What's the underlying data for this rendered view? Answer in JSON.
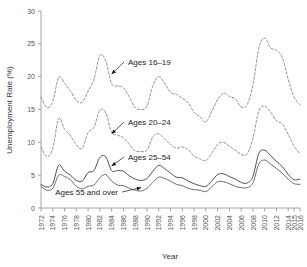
{
  "chart_data": {
    "type": "line",
    "title": "",
    "xlabel": "Year",
    "ylabel": "Unemployment Rate (%)",
    "xlim": [
      1972,
      2016
    ],
    "ylim": [
      0,
      30
    ],
    "ytick_values": [
      0,
      5,
      10,
      15,
      20,
      25,
      30
    ],
    "ytick_labels": [
      "0",
      "5",
      "10",
      "15",
      "20",
      "25",
      "30"
    ],
    "xtick_values": [
      1972,
      1974,
      1976,
      1978,
      1980,
      1982,
      1984,
      1986,
      1988,
      1990,
      1992,
      1994,
      1996,
      1998,
      2000,
      2002,
      2004,
      2006,
      2008,
      2010,
      2012,
      2014,
      2015,
      2016
    ],
    "xtick_labels": [
      "1972",
      "1974",
      "1976",
      "1978",
      "1980",
      "1982",
      "1984",
      "1986",
      "1988",
      "1990",
      "1992",
      "1994",
      "1996",
      "1998",
      "2000",
      "2002",
      "2004",
      "2006",
      "2008",
      "2010",
      "2012",
      "2014",
      "2015",
      "2016"
    ],
    "grid": false,
    "legend_position": "inline-annotations",
    "x": [
      1972,
      1973,
      1974,
      1975,
      1976,
      1977,
      1978,
      1979,
      1980,
      1981,
      1982,
      1983,
      1984,
      1985,
      1986,
      1987,
      1988,
      1989,
      1990,
      1991,
      1992,
      1993,
      1994,
      1995,
      1996,
      1997,
      1998,
      1999,
      2000,
      2001,
      2002,
      2003,
      2004,
      2005,
      2006,
      2007,
      2008,
      2009,
      2010,
      2011,
      2012,
      2013,
      2014,
      2015,
      2016
    ],
    "series": [
      {
        "name": "Ages 16–19",
        "style": "dashed",
        "color": "#8a8a8a",
        "values": [
          16.9,
          15.3,
          16.2,
          19.9,
          19.0,
          17.8,
          16.4,
          16.1,
          17.8,
          19.6,
          23.2,
          22.4,
          18.9,
          18.6,
          18.3,
          16.9,
          15.3,
          15.0,
          15.5,
          18.6,
          20.0,
          19.0,
          17.6,
          17.3,
          16.7,
          16.0,
          14.6,
          13.9,
          13.1,
          14.7,
          16.5,
          17.5,
          17.0,
          16.6,
          15.4,
          15.7,
          18.7,
          24.3,
          25.9,
          24.4,
          24.0,
          22.9,
          19.6,
          16.9,
          15.7
        ],
        "label_text": "Ages 16–19"
      },
      {
        "name": "Ages 20–24",
        "style": "dashed",
        "color": "#8a8a8a",
        "values": [
          9.3,
          7.8,
          9.1,
          13.6,
          12.0,
          11.0,
          9.6,
          9.1,
          11.5,
          12.3,
          14.9,
          14.5,
          11.5,
          11.1,
          10.7,
          9.7,
          8.7,
          8.6,
          8.8,
          10.8,
          11.3,
          10.5,
          9.7,
          9.1,
          9.3,
          8.9,
          7.9,
          7.5,
          7.2,
          8.3,
          9.7,
          10.0,
          9.4,
          8.8,
          8.2,
          8.2,
          10.6,
          14.8,
          15.5,
          14.6,
          13.3,
          12.8,
          11.2,
          9.4,
          8.3
        ],
        "label_text": "Ages 20–24"
      },
      {
        "name": "Ages 25–54",
        "style": "solid",
        "color": "#4d4d4d",
        "values": [
          3.6,
          3.2,
          3.7,
          6.5,
          5.6,
          5.0,
          4.2,
          4.1,
          5.4,
          5.7,
          7.7,
          7.8,
          5.7,
          5.7,
          5.6,
          4.9,
          4.4,
          4.2,
          4.5,
          5.6,
          6.5,
          6.0,
          5.3,
          4.7,
          4.6,
          4.1,
          3.7,
          3.4,
          3.3,
          4.1,
          5.1,
          5.2,
          4.8,
          4.4,
          3.9,
          3.8,
          4.8,
          8.3,
          8.8,
          8.0,
          7.1,
          6.3,
          5.1,
          4.3,
          4.4
        ],
        "label_text": "Ages 25–54"
      },
      {
        "name": "Ages 55 and over",
        "style": "solid",
        "color": "#6b6b6b",
        "values": [
          3.3,
          2.7,
          3.0,
          5.0,
          4.8,
          4.3,
          3.3,
          2.9,
          3.3,
          3.5,
          4.6,
          5.1,
          4.1,
          3.5,
          3.4,
          3.0,
          2.7,
          2.6,
          3.0,
          3.9,
          4.7,
          4.5,
          4.1,
          3.6,
          3.4,
          3.0,
          2.8,
          2.7,
          2.5,
          3.2,
          4.0,
          4.0,
          3.7,
          3.3,
          3.1,
          3.1,
          3.8,
          6.7,
          7.3,
          6.7,
          6.0,
          5.3,
          4.4,
          3.7,
          3.6
        ],
        "label_text": "Ages 55 and over"
      }
    ],
    "annotations": [
      {
        "text": "Ages 16–19",
        "point_x": 1984,
        "point_y": 20.4
      },
      {
        "text": "Ages 20–24",
        "point_x": 1984,
        "point_y": 11.3
      },
      {
        "text": "Ages 25–54",
        "point_x": 1984,
        "point_y": 6.4
      },
      {
        "text": "Ages 55 and over",
        "point_x": 1989,
        "point_y": 3.1
      }
    ]
  },
  "axes": {
    "ylabel": "Unemployment Rate (%)",
    "xlabel": "Year"
  }
}
